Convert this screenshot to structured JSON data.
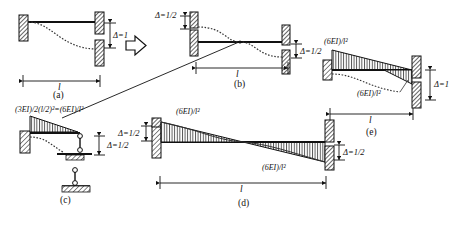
{
  "figure": {
    "background_color": "#ffffff",
    "ink_color": "#111111",
    "hatch_color": "#333333"
  },
  "panels": [
    {
      "id": "a",
      "caption": "(a)",
      "span_label": "l",
      "delta_label": "Δ=1",
      "description": "Fixed-fixed beam with right support displaced downward by unit settlement"
    },
    {
      "id": "b",
      "caption": "(b)",
      "span_label": "l",
      "delta_label_left": "Δ=1/2",
      "delta_label_right": "Δ=1/2",
      "description": "Antisymmetric S-curve deflected shape, half settlement at each end"
    },
    {
      "id": "c",
      "caption": "(c)",
      "formula": "(3EI)/2(l/2)²=(6EI)/l²",
      "delta_label": "Δ=1/2",
      "description": "Propped cantilever half-span model with moment diagram"
    },
    {
      "id": "d",
      "caption": "(d)",
      "span_label": "l",
      "moment_label_top": "(6EI)/l²",
      "moment_label_bottom": "(6EI)/l²",
      "delta_label_left": "Δ=1/2",
      "delta_label_right": "Δ=1/2",
      "description": "Antisymmetric bending moment diagram, equal end moments"
    },
    {
      "id": "e",
      "caption": "(e)",
      "span_label": "l",
      "moment_label_top": "(6EI)/l²",
      "moment_label_bottom": "(6EI)/l²",
      "delta_label": "Δ=1",
      "description": "Combined result: fixed end moments for unit settlement"
    }
  ],
  "transition_arrow": {
    "name": "block-arrow-right",
    "direction": "right"
  },
  "leader_line": {
    "name": "formula-leader",
    "from": "panel-c-formula",
    "to": "panel-b-midpoint"
  }
}
